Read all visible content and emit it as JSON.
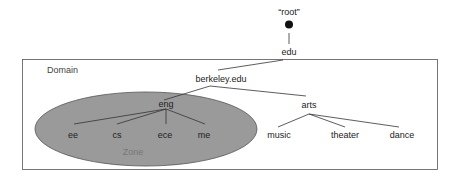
{
  "diagram": {
    "type": "dns-namespace-tree",
    "colors": {
      "zone_fill": "#9a9a9a",
      "zone_stroke": "#555555",
      "line": "#333333",
      "box": "#555555",
      "root_dot": "#111111"
    },
    "regions": {
      "domain": {
        "label": "Domain"
      },
      "zone": {
        "label": "Zone"
      }
    },
    "nodes": {
      "root": {
        "label": "“root”"
      },
      "edu": {
        "label": "edu"
      },
      "berkeley": {
        "label": "berkeley.edu"
      },
      "eng": {
        "label": "eng"
      },
      "arts": {
        "label": "arts"
      },
      "ee": {
        "label": "ee"
      },
      "cs": {
        "label": "cs"
      },
      "ece": {
        "label": "ece"
      },
      "me": {
        "label": "me"
      },
      "music": {
        "label": "music"
      },
      "theater": {
        "label": "theater"
      },
      "dance": {
        "label": "dance"
      }
    },
    "edges": [
      [
        "root",
        "edu"
      ],
      [
        "edu",
        "berkeley"
      ],
      [
        "berkeley",
        "eng"
      ],
      [
        "berkeley",
        "arts"
      ],
      [
        "eng",
        "ee"
      ],
      [
        "eng",
        "cs"
      ],
      [
        "eng",
        "ece"
      ],
      [
        "eng",
        "me"
      ],
      [
        "arts",
        "music"
      ],
      [
        "arts",
        "theater"
      ],
      [
        "arts",
        "dance"
      ]
    ]
  }
}
